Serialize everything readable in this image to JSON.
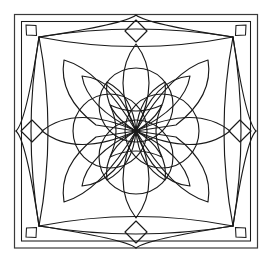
{
  "artwork": {
    "title": "Symmetrical Floral Quilt Block Line Drawing",
    "type": "line-art-coloring-page",
    "canvas": {
      "width": 271,
      "height": 270
    },
    "colors": {
      "background": "#ffffff",
      "line": "#1a1a1a",
      "frame": "#3a3a3a"
    },
    "frame": {
      "outer": {
        "x": 14.5,
        "y": 14.5,
        "width": 243,
        "height": 233.5
      },
      "corner_squares": [
        {
          "name": "corner-square-top-left",
          "cx": 31,
          "cy": 30
        },
        {
          "name": "corner-square-top-right",
          "cx": 241,
          "cy": 30
        },
        {
          "name": "corner-square-bottom-left",
          "cx": 31,
          "cy": 233
        },
        {
          "name": "corner-square-bottom-right",
          "cx": 241,
          "cy": 233
        }
      ],
      "corner_square_size": 11
    },
    "geometry": {
      "center": {
        "x": 136,
        "y": 131
      },
      "node_top_left": {
        "x": 39,
        "y": 37
      },
      "node_top_right": {
        "x": 233,
        "y": 37
      },
      "node_bottom_left": {
        "x": 39,
        "y": 226
      },
      "node_bottom_right": {
        "x": 233,
        "y": 226
      },
      "edge_diamond_half": 11,
      "inner_circle_radius": 37,
      "inner_circle_offset": 26,
      "petal_count_diagonal": 4,
      "petal_count_axial": 4,
      "outer_petal_count": 8
    },
    "labels": {
      "border": "decorative-border",
      "rosette": "central-rosette",
      "petals": "flower-petals",
      "lens": "edge-lens-arcs"
    }
  }
}
